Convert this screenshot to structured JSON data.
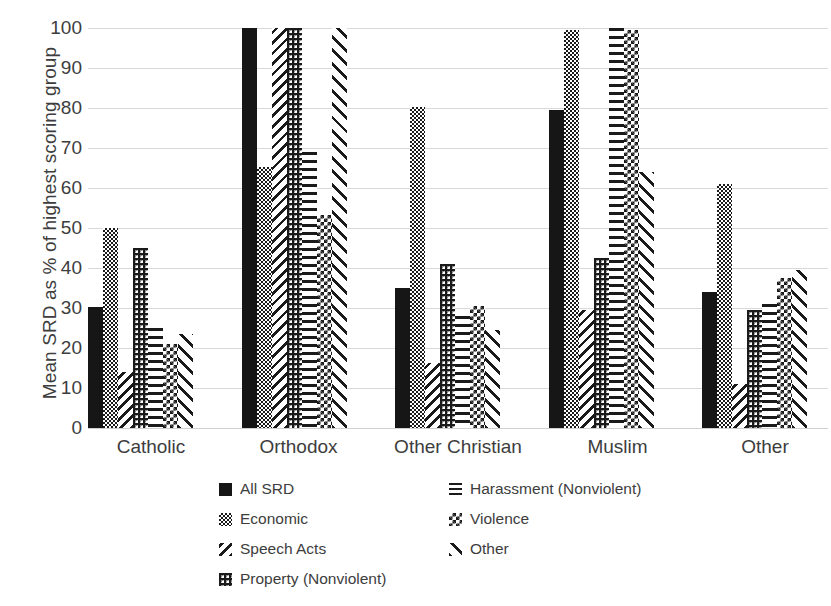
{
  "chart_data": {
    "type": "bar",
    "title": "",
    "xlabel": "",
    "ylabel": "Mean SRD as % of highest scoring group",
    "ylim": [
      0,
      100
    ],
    "yticks": [
      0,
      10,
      20,
      30,
      40,
      50,
      60,
      70,
      80,
      90,
      100
    ],
    "grid": true,
    "legend_position": "bottom",
    "categories": [
      "Catholic",
      "Orthodox",
      "Other Christian",
      "Muslim",
      "Other"
    ],
    "series": [
      {
        "name": "All SRD",
        "pattern": "solid-black",
        "values": [
          30.3,
          100.0,
          35.0,
          79.6,
          34.0
        ]
      },
      {
        "name": "Economic",
        "pattern": "fine-checker",
        "values": [
          50.0,
          65.2,
          80.2,
          99.5,
          61.0
        ]
      },
      {
        "name": "Speech Acts",
        "pattern": "light-diagonal",
        "values": [
          14.0,
          100.0,
          16.3,
          29.5,
          11.0
        ]
      },
      {
        "name": "Property (Nonviolent)",
        "pattern": "dense-cross-dots",
        "values": [
          45.0,
          100.0,
          41.0,
          42.5,
          29.5
        ]
      },
      {
        "name": "Harassment (Nonviolent)",
        "pattern": "horizontal-dashes",
        "values": [
          25.0,
          69.0,
          28.0,
          100.0,
          31.0
        ]
      },
      {
        "name": "Violence",
        "pattern": "coarse-checker",
        "values": [
          21.0,
          53.2,
          30.5,
          99.5,
          37.5
        ]
      },
      {
        "name": "Other",
        "pattern": "backward-diagonal",
        "values": [
          23.5,
          100.0,
          24.5,
          64.0,
          39.5
        ]
      }
    ]
  },
  "legend": {
    "left_column": [
      {
        "label": "All SRD",
        "swatch": "solid-black"
      },
      {
        "label": "Economic",
        "swatch": "fine-checker"
      },
      {
        "label": "Speech Acts",
        "swatch": "light-diagonal"
      },
      {
        "label": "Property (Nonviolent)",
        "swatch": "dense-cross-dots"
      }
    ],
    "right_column": [
      {
        "label": "Harassment (Nonviolent)",
        "swatch": "horizontal-dashes"
      },
      {
        "label": "Violence",
        "swatch": "coarse-checker"
      },
      {
        "label": "Other",
        "swatch": "backward-diagonal"
      }
    ]
  },
  "colors": {
    "ink": "#1a1a1a",
    "text": "#3d3d3d",
    "gridline": "#d9d9d9",
    "background": "#ffffff"
  }
}
